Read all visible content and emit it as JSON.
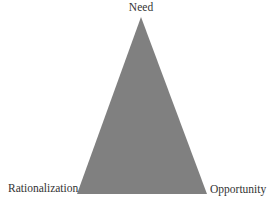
{
  "diagram": {
    "type": "triangle",
    "fill_color": "#808080",
    "vertices": {
      "top": {
        "label": "Need"
      },
      "bottom_left": {
        "label": "Rationalization"
      },
      "bottom_right": {
        "label": "Opportunity"
      }
    }
  }
}
